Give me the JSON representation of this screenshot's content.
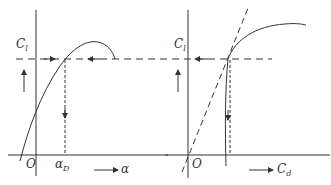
{
  "diagram": {
    "left_panel": {
      "y_axis_label": "C",
      "y_axis_sub": "l",
      "x_axis_label": "α",
      "origin_label": "O",
      "marker_label": "α",
      "marker_sub": "D",
      "curve": "lift curve C_l vs α"
    },
    "right_panel": {
      "y_axis_label": "C",
      "y_axis_sub": "l",
      "x_axis_label": "C",
      "x_axis_sub": "d",
      "origin_label": "O",
      "curve": "drag polar C_l vs C_d with tangent from origin"
    },
    "colors": {
      "line": "#333333",
      "background": "#ffffff"
    }
  }
}
